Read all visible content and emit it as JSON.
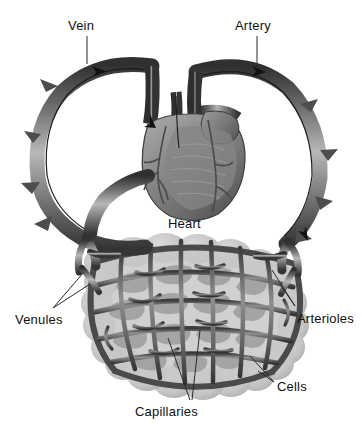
{
  "diagram": {
    "style": "grayscale anatomical illustration",
    "background_color": "#ffffff",
    "labels": {
      "vein": "Vein",
      "artery": "Artery",
      "heart": "Heart",
      "venules": "Venules",
      "arterioles": "Arterioles",
      "cells": "Cells",
      "capillaries": "Capillaries"
    },
    "colors": {
      "vessel_dark": "#3a3a3a",
      "vessel_mid": "#6e6e6e",
      "vessel_light": "#a8a8a8",
      "vessel_highlight": "#d2d2d2",
      "heart_dark": "#555555",
      "heart_mid": "#7c7c7c",
      "heart_light": "#9a9a9a",
      "cell_fill": "#c9c9c9",
      "cell_fill_dark": "#9c9c9c",
      "mesh_wall": "#4a4a4a",
      "label_text": "#101010",
      "leader_line": "#2a2a2a"
    },
    "flow_arrows": [
      {
        "vessel": "vein",
        "location": "upper-left",
        "direction": "right-toward-heart"
      },
      {
        "vessel": "vein",
        "location": "center-top",
        "direction": "down-into-heart"
      },
      {
        "vessel": "artery",
        "location": "upper-right",
        "direction": "right-away-from-heart"
      },
      {
        "vessel": "artery",
        "location": "lower-right",
        "direction": "down-toward-capillaries"
      }
    ],
    "leader_counts": {
      "vein": 1,
      "artery": 1,
      "heart": 0,
      "venules": 2,
      "arterioles": 2,
      "cells": 2,
      "capillaries": 2
    }
  }
}
